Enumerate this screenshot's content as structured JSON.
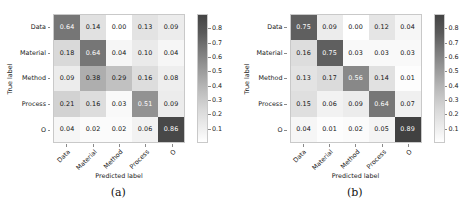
{
  "figure": {
    "colormap": {
      "low_color": "#ffffff",
      "high_color": "#3f3f3f",
      "vmin": 0,
      "vmax": 0.9
    },
    "colorbar_ticks": [
      "0.8",
      "0.7",
      "0.6",
      "0.5",
      "0.4",
      "0.3",
      "0.2",
      "0.1"
    ],
    "colorbar_tick_values": [
      0.8,
      0.7,
      0.6,
      0.5,
      0.4,
      0.3,
      0.2,
      0.1
    ]
  },
  "panels": [
    {
      "caption": "(a)",
      "xlabel": "Predicted label",
      "ylabel": "True label",
      "chart_data": {
        "type": "heatmap",
        "title": "",
        "xlabel": "Predicted label",
        "ylabel": "True label",
        "x_tick_labels": [
          "Data",
          "Material",
          "Method",
          "Process",
          "O"
        ],
        "y_tick_labels": [
          "Data",
          "Material",
          "Method",
          "Process",
          "O"
        ],
        "categories": [
          "Data",
          "Material",
          "Method",
          "Process",
          "O"
        ],
        "values": [
          [
            0.64,
            0.14,
            0.0,
            0.13,
            0.09
          ],
          [
            0.18,
            0.64,
            0.04,
            0.1,
            0.04
          ],
          [
            0.09,
            0.38,
            0.29,
            0.16,
            0.08
          ],
          [
            0.21,
            0.16,
            0.03,
            0.51,
            0.09
          ],
          [
            0.04,
            0.02,
            0.02,
            0.06,
            0.86
          ]
        ],
        "cell_text": [
          [
            "0.64",
            "0.14",
            "0.00",
            "0.13",
            "0.09"
          ],
          [
            "0.18",
            "0.64",
            "0.04",
            "0.10",
            "0.04"
          ],
          [
            "0.09",
            "0.38",
            "0.29",
            "0.16",
            "0.08"
          ],
          [
            "0.21",
            "0.16",
            "0.03",
            "0.51",
            "0.09"
          ],
          [
            "0.04",
            "0.02",
            "0.02",
            "0.06",
            "0.86"
          ]
        ],
        "colorbar_ticks": [
          0.1,
          0.2,
          0.3,
          0.4,
          0.5,
          0.6,
          0.7,
          0.8
        ],
        "grid": false,
        "legend_position": "right"
      }
    },
    {
      "caption": "(b)",
      "xlabel": "Predicted label",
      "ylabel": "True label",
      "chart_data": {
        "type": "heatmap",
        "title": "",
        "xlabel": "Predicted label",
        "ylabel": "True label",
        "x_tick_labels": [
          "Data",
          "Material",
          "Method",
          "Process",
          "O"
        ],
        "y_tick_labels": [
          "Data",
          "Material",
          "Method",
          "Process",
          "O"
        ],
        "categories": [
          "Data",
          "Material",
          "Method",
          "Process",
          "O"
        ],
        "values": [
          [
            0.75,
            0.09,
            0.0,
            0.12,
            0.04
          ],
          [
            0.16,
            0.75,
            0.03,
            0.03,
            0.03
          ],
          [
            0.13,
            0.17,
            0.56,
            0.14,
            0.01
          ],
          [
            0.15,
            0.06,
            0.09,
            0.64,
            0.07
          ],
          [
            0.04,
            0.01,
            0.02,
            0.05,
            0.89
          ]
        ],
        "cell_text": [
          [
            "0.75",
            "0.09",
            "0.00",
            "0.12",
            "0.04"
          ],
          [
            "0.16",
            "0.75",
            "0.03",
            "0.03",
            "0.03"
          ],
          [
            "0.13",
            "0.17",
            "0.56",
            "0.14",
            "0.01"
          ],
          [
            "0.15",
            "0.06",
            "0.09",
            "0.64",
            "0.07"
          ],
          [
            "0.04",
            "0.01",
            "0.02",
            "0.05",
            "0.89"
          ]
        ],
        "colorbar_ticks": [
          0.1,
          0.2,
          0.3,
          0.4,
          0.5,
          0.6,
          0.7,
          0.8
        ],
        "grid": false,
        "legend_position": "right"
      }
    }
  ]
}
